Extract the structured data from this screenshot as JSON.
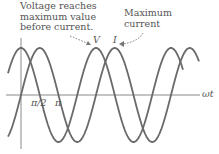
{
  "annotations": {
    "voltage_note_line1": "Voltage reaches",
    "voltage_note_line2": "maximum value",
    "voltage_note_line3": "before current.",
    "current_note_line1": "Maximum",
    "current_note_line2": "current"
  },
  "labels": {
    "voltage_symbol": "V",
    "current_symbol": "I",
    "x_axis": "ωt",
    "tick_half_pi": "π/2",
    "tick_pi": "π"
  },
  "chart_data": {
    "type": "line",
    "title": "",
    "xlabel": "ωt",
    "ylabel": "",
    "x_ticks": [
      "π/2",
      "π"
    ],
    "series": [
      {
        "name": "V",
        "function": "cos(ωt)",
        "peaks_at": [
          "0",
          "2π",
          "4π"
        ]
      },
      {
        "name": "I",
        "function": "sin(ωt)",
        "peaks_at": [
          "π/2",
          "5π/2",
          "9π/2"
        ]
      }
    ],
    "x_range": [
      "-π/2 (approx)",
      "≈4.7π"
    ],
    "annotations": [
      "Voltage reaches maximum value before current.",
      "Maximum current"
    ],
    "colors": {
      "curves": "#666666",
      "axes": "#888888",
      "text": "#555555"
    }
  }
}
